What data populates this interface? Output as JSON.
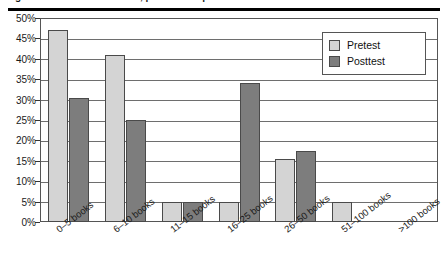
{
  "caption": {
    "text": "Figure 2. Books in the home, pretest and posttest",
    "rule_color": "#000000"
  },
  "chart_data": {
    "type": "bar",
    "title": "",
    "xlabel": "",
    "ylabel": "",
    "ylim": [
      0,
      50
    ],
    "yticks": [
      "0%",
      "5%",
      "10%",
      "15%",
      "20%",
      "25%",
      "30%",
      "35%",
      "40%",
      "45%",
      "50%"
    ],
    "ytick_values": [
      0,
      5,
      10,
      15,
      20,
      25,
      30,
      35,
      40,
      45,
      50
    ],
    "grid": true,
    "legend_position": "top-right",
    "categories": [
      "0–5 books",
      "6–10 books",
      "11–15 books",
      "16–25 books",
      "26–50 books",
      "51–100 books",
      ">100 books"
    ],
    "series": [
      {
        "name": "Pretest",
        "color": "#d4d4d4",
        "values": [
          47,
          41,
          5,
          5,
          15.5,
          5,
          0
        ]
      },
      {
        "name": "Posttest",
        "color": "#7d7d7d",
        "values": [
          30.5,
          25,
          5,
          34,
          17.5,
          0,
          0
        ]
      }
    ]
  },
  "legend": {
    "items": [
      {
        "label": "Pretest"
      },
      {
        "label": "Posttest"
      }
    ]
  }
}
